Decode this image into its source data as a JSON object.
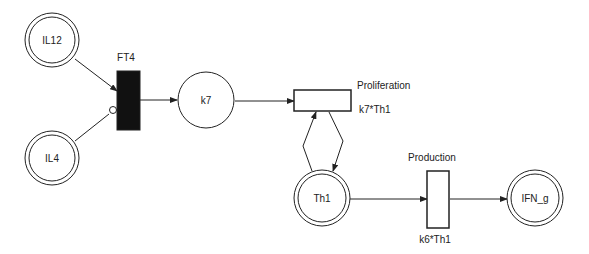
{
  "diagram": {
    "type": "petri-net",
    "places": [
      {
        "id": "IL12",
        "label": "IL12",
        "double": true
      },
      {
        "id": "IL4",
        "label": "IL4",
        "double": true
      },
      {
        "id": "k7",
        "label": "k7",
        "double": false
      },
      {
        "id": "Th1",
        "label": "Th1",
        "double": true
      },
      {
        "id": "IFN_g",
        "label": "IFN_g",
        "double": true
      }
    ],
    "transitions": [
      {
        "id": "FT4",
        "label": "FT4",
        "filled": true
      },
      {
        "id": "Proliferation",
        "label": "Proliferation",
        "rate": "k7*Th1"
      },
      {
        "id": "Production",
        "label": "Production",
        "rate": "k6*Th1"
      }
    ],
    "arcs": [
      {
        "from": "IL12",
        "to": "FT4",
        "type": "normal"
      },
      {
        "from": "IL4",
        "to": "FT4",
        "type": "inhibitor"
      },
      {
        "from": "FT4",
        "to": "k7",
        "type": "normal"
      },
      {
        "from": "k7",
        "to": "Proliferation",
        "type": "normal"
      },
      {
        "from": "Th1",
        "to": "Proliferation",
        "type": "normal"
      },
      {
        "from": "Proliferation",
        "to": "Th1",
        "type": "normal"
      },
      {
        "from": "Th1",
        "to": "Production",
        "type": "normal"
      },
      {
        "from": "Production",
        "to": "IFN_g",
        "type": "normal"
      }
    ]
  }
}
